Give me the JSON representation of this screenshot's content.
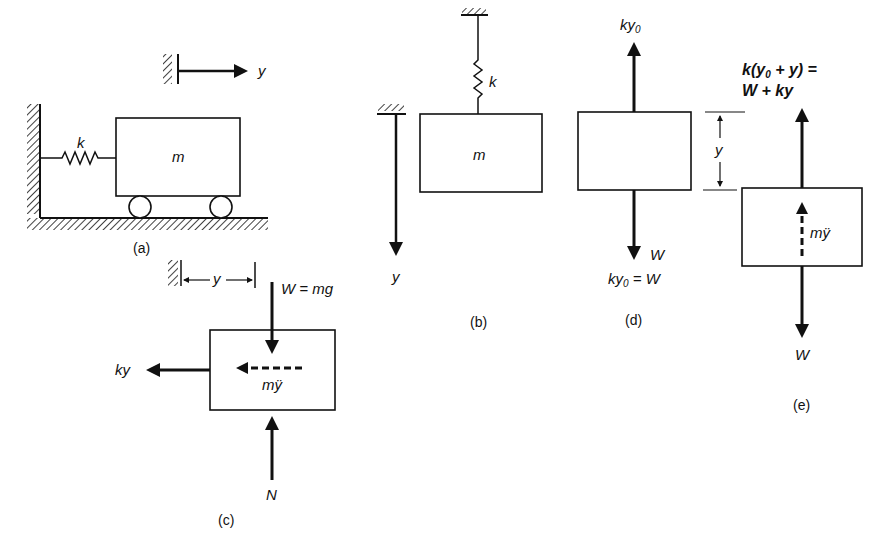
{
  "figure": {
    "panels": [
      {
        "id": "a",
        "caption": "(a)",
        "description": "Mass on wheels attached to wall by spring, horizontal displacement y",
        "labels": {
          "spring": "k",
          "mass": "m",
          "displacement": "y"
        }
      },
      {
        "id": "b",
        "caption": "(b)",
        "description": "Mass hanging from spring, vertical displacement y downward",
        "labels": {
          "spring": "k",
          "mass": "m",
          "displacement": "y"
        }
      },
      {
        "id": "c",
        "caption": "(c)",
        "description": "Free body diagram of horizontal system",
        "labels": {
          "displacement": "y",
          "weight": "W = mg",
          "spring_force": "ky",
          "inertia": "mÿ",
          "normal": "N"
        }
      },
      {
        "id": "d",
        "caption": "(d)",
        "description": "Static equilibrium of hanging mass",
        "labels": {
          "spring_force_prefix": "ky",
          "spring_force_sub": "0",
          "weight": "W",
          "equation_prefix": "ky",
          "equation_sub": "0",
          "equation_suffix": " = W",
          "displacement": "y"
        }
      },
      {
        "id": "e",
        "caption": "(e)",
        "description": "Dynamic free body diagram of displaced hanging mass",
        "labels": {
          "top_line1_a": "k(y",
          "top_line1_sub": "0",
          "top_line1_b": " + y) =",
          "top_line2": "W + ky",
          "inertia": "mÿ",
          "weight": "W",
          "displacement": "y"
        }
      }
    ]
  }
}
